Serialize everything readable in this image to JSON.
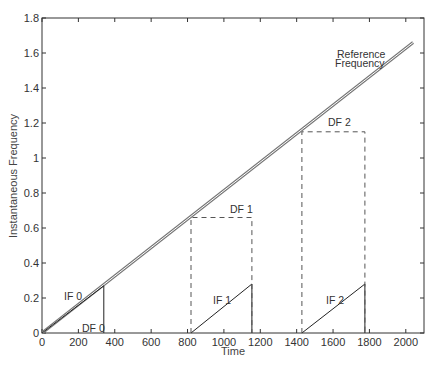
{
  "chart_data": {
    "type": "line",
    "title": "",
    "xlabel": "Time",
    "ylabel": "Instantaneous Frequency",
    "xlim": [
      0,
      2100
    ],
    "ylim": [
      0,
      1.8
    ],
    "grid": false,
    "legend": null,
    "xticks": [
      0,
      200,
      400,
      600,
      800,
      1000,
      1200,
      1400,
      1600,
      1800,
      2000
    ],
    "xtick_labels": [
      "0",
      "200",
      "400",
      "600",
      "800",
      "1000",
      "1200",
      "1400",
      "1600",
      "1800",
      "2000"
    ],
    "yticks": [
      0,
      0.2,
      0.4,
      0.6,
      0.8,
      1.0,
      1.2,
      1.4,
      1.6,
      1.8
    ],
    "ytick_labels": [
      "0",
      "0.2",
      "0.4",
      "0.6",
      "0.8",
      "1",
      "1.2",
      "1.4",
      "1.6",
      "1.8"
    ],
    "series": [
      {
        "name": "Reference Frequency",
        "style": "double-line",
        "x": [
          0,
          2040
        ],
        "y": [
          0,
          1.66
        ]
      },
      {
        "name": "IF 0",
        "style": "solid",
        "x": [
          0,
          340,
          340
        ],
        "y": [
          0,
          0.27,
          0
        ]
      },
      {
        "name": "IF 1",
        "style": "solid",
        "x": [
          819,
          1154,
          1154
        ],
        "y": [
          0,
          0.28,
          0
        ]
      },
      {
        "name": "IF 2",
        "style": "solid",
        "x": [
          1429,
          1775,
          1775
        ],
        "y": [
          0,
          0.28,
          0
        ]
      },
      {
        "name": "DF 1",
        "style": "dashed",
        "x": [
          819,
          819,
          1154,
          1154
        ],
        "y": [
          0,
          0.66,
          0.66,
          0
        ]
      },
      {
        "name": "DF 2",
        "style": "dashed",
        "x": [
          1429,
          1429,
          1775,
          1775
        ],
        "y": [
          0,
          1.15,
          1.15,
          0
        ]
      }
    ],
    "annotations": [
      {
        "text": "Reference",
        "x": 1710,
        "y": 1.5
      },
      {
        "text": "Frequency",
        "x": 1710,
        "y": 1.45
      },
      {
        "text": "IF 0",
        "x": 110,
        "y": 0.25
      },
      {
        "text": "DF 0",
        "x": 220,
        "y": 0.02
      },
      {
        "text": "DF 1",
        "x": 1010,
        "y": 0.68
      },
      {
        "text": "DF 2",
        "x": 1620,
        "y": 1.17
      },
      {
        "text": "IF 1",
        "x": 975,
        "y": 0.19
      },
      {
        "text": "IF 2",
        "x": 1575,
        "y": 0.19
      }
    ]
  },
  "labels": {
    "xlabel": "Time",
    "ylabel": "Instantaneous Frequency",
    "ref_line1": "Reference",
    "ref_line2": "Frequency",
    "if0": "IF 0",
    "df0": "DF 0",
    "if1": "IF 1",
    "df1": "DF 1",
    "if2": "IF 2",
    "df2": "DF 2"
  },
  "colors": {
    "axis": "#333333",
    "reference": "#777777",
    "solid": "#222222",
    "dashed": "#555555"
  }
}
